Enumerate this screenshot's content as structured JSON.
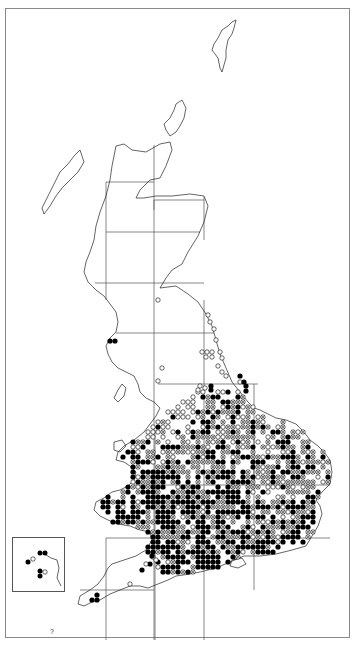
{
  "map": {
    "type": "species distribution map",
    "region": "Great Britain",
    "grid": "100 km squares",
    "frame_color": "#8a8a8a",
    "symbol_colors": {
      "filled": "#000000",
      "open": "#000000",
      "background": "#ffffff"
    },
    "legend_symbols": [
      {
        "name": "filled-dot",
        "meaning": "recent record"
      },
      {
        "name": "crossed-circle",
        "meaning": "intermediate record"
      },
      {
        "name": "open-circle",
        "meaning": "old record"
      }
    ],
    "inset": {
      "label": "Channel Islands inset"
    },
    "corner_mark": "?",
    "dot_spacing_px": 5
  }
}
